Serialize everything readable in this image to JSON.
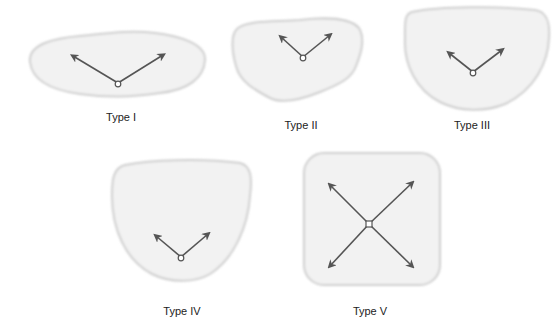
{
  "colors": {
    "background": "#ffffff",
    "shape_fill": "#f2f2f2",
    "shape_edge": "#cfcfcf",
    "arrow": "#555555",
    "label": "#222222"
  },
  "diagram": {
    "types": [
      {
        "id": "type-1",
        "label": "Type I",
        "shape": "elongated-horizontal-blob",
        "arrow_count": 2,
        "pivot": "circle",
        "arrow_directions": [
          "up-left",
          "up-right"
        ]
      },
      {
        "id": "type-2",
        "label": "Type II",
        "shape": "irregular-rounded-blob",
        "arrow_count": 2,
        "pivot": "circle",
        "arrow_directions": [
          "up-left",
          "up-right"
        ]
      },
      {
        "id": "type-3",
        "label": "Type III",
        "shape": "rounded-bowl",
        "arrow_count": 2,
        "pivot": "circle",
        "arrow_directions": [
          "up-left",
          "up-right"
        ]
      },
      {
        "id": "type-4",
        "label": "Type IV",
        "shape": "tall-rounded-bowl",
        "arrow_count": 2,
        "pivot": "circle",
        "arrow_directions": [
          "up-left",
          "up-right"
        ]
      },
      {
        "id": "type-5",
        "label": "Type V",
        "shape": "rounded-square",
        "arrow_count": 4,
        "pivot": "square",
        "arrow_directions": [
          "up-left",
          "up-right",
          "down-left",
          "down-right"
        ]
      }
    ]
  }
}
